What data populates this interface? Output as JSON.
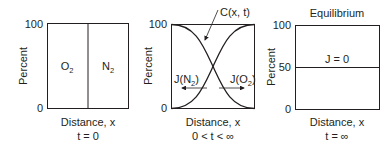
{
  "panels": [
    {
      "ylabel": "Percent",
      "ticks": [
        "100",
        "0"
      ],
      "regions": [
        {
          "label": "O",
          "sub": "2"
        },
        {
          "label": "N",
          "sub": "2"
        }
      ],
      "xlabel": "Distance, x",
      "time": "t = 0"
    },
    {
      "ylabel": "Percent",
      "ticks": [
        "100",
        "0"
      ],
      "curve_label": "C(x, t)",
      "flux_left": {
        "label": "J(N",
        "sub": "2",
        "close": ")"
      },
      "flux_right": {
        "label": "J(O",
        "sub": "2",
        "close": ")"
      },
      "xlabel": "Distance, x",
      "time": "0 < t < ∞"
    },
    {
      "title": "Equilibrium",
      "ylabel": "Percent",
      "ticks": [
        "100",
        "50",
        "0"
      ],
      "line_label": "J = 0",
      "xlabel": "Distance, x",
      "time": "t = ∞"
    }
  ],
  "colors": {
    "line": "#231f20",
    "frame": "#231f20"
  }
}
